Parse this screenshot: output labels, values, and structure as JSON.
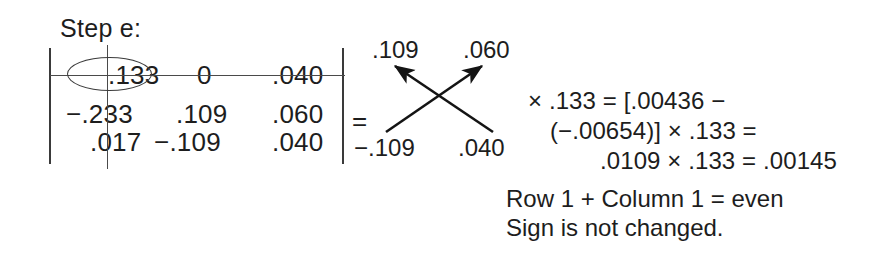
{
  "figure": {
    "step_label": "Step e:",
    "background_color": "#ffffff",
    "ink_color": "#1d1d1d"
  },
  "matrix": {
    "bracket_left": "|",
    "bracket_right": "|",
    "rows": [
      {
        "cells": [
          ".133",
          "0",
          ".040"
        ]
      },
      {
        "cells": [
          "−.233",
          ".109",
          ".060"
        ]
      },
      {
        "cells": [
          ".017",
          "−.109",
          ".040"
        ]
      }
    ],
    "struck_row_index": 0,
    "struck_column_index": 0,
    "circled_cell": ".133",
    "equals_sign": "="
  },
  "cross_diagram": {
    "top_left": ".109",
    "top_right": ".060",
    "bottom_left": "−.109",
    "bottom_right": ".040",
    "arrow_up_left_label": ".109",
    "arrow_up_right_label": ".060"
  },
  "calculation": {
    "line1": "× .133 = [.00436 −",
    "line2": "(−.00654)] × .133 =",
    "line3": ".0109 × .133 = .00145"
  },
  "notes": {
    "line1": "Row  1 + Column  1 = even",
    "line2": "Sign is not changed."
  }
}
